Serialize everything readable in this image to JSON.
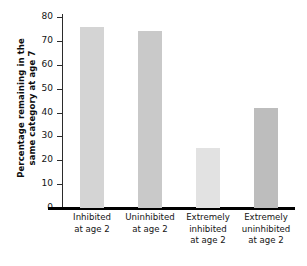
{
  "chart_data": {
    "type": "bar",
    "title": "",
    "xlabel": "",
    "ylabel": "Percentage remaining in the\nsame category at age 7",
    "categories": [
      "Inhibited\nat age 2",
      "Uninhibited\nat age 2",
      "Extremely\ninhibited\nat age 2",
      "Extremely\nuninhibited\nat age 2"
    ],
    "values": [
      76,
      74,
      25,
      42
    ],
    "ylim": [
      0,
      80
    ],
    "yticks": [
      0,
      10,
      20,
      30,
      40,
      50,
      60,
      70,
      80
    ],
    "ytick_labels": [
      "0",
      "10",
      "20",
      "30",
      "40",
      "50",
      "60",
      "70",
      "80"
    ],
    "grid": false,
    "legend": false,
    "bar_colors": [
      "#d4d4d4",
      "#c9c9c9",
      "#e2e2e2",
      "#bdbdbd"
    ],
    "axis_color": "#000000"
  },
  "axis": {
    "y_title": "Percentage remaining in the\nsame category at age 7"
  }
}
